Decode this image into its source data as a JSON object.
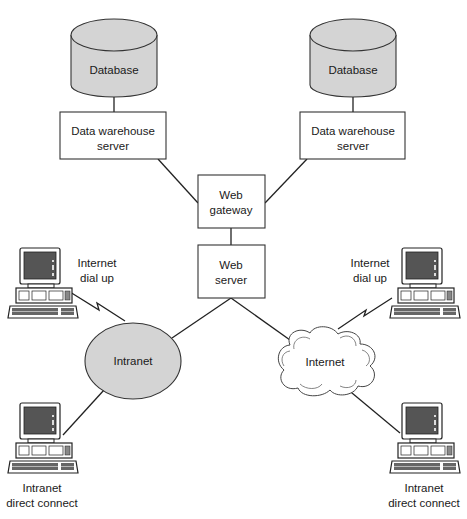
{
  "diagram": {
    "databases": [
      {
        "label": "Database"
      },
      {
        "label": "Database"
      }
    ],
    "warehouse_servers": [
      {
        "line1": "Data warehouse",
        "line2": "server"
      },
      {
        "line1": "Data warehouse",
        "line2": "server"
      }
    ],
    "web_gateway": {
      "line1": "Web",
      "line2": "gateway"
    },
    "web_server": {
      "line1": "Web",
      "line2": "server"
    },
    "intranet": {
      "label": "Intranet"
    },
    "internet": {
      "label": "Internet"
    },
    "clients": {
      "top_left": {
        "line1": "Internet",
        "line2": "dial up"
      },
      "top_right": {
        "line1": "Internet",
        "line2": "dial up"
      },
      "bottom_left": {
        "line1": "Intranet",
        "line2": "direct connect"
      },
      "bottom_right": {
        "line1": "Intranet",
        "line2": "direct connect"
      }
    },
    "colors": {
      "shape_fill": "#d4d4d4",
      "stroke": "#333333",
      "background": "#ffffff"
    }
  }
}
